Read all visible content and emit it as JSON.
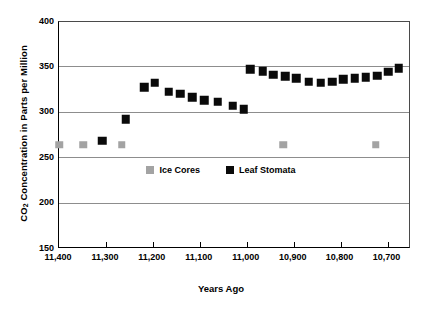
{
  "chart_data": {
    "type": "scatter",
    "title": "",
    "xlabel": "Years Ago",
    "ylabel": "CO2 Concentration in Parts per Million",
    "ylabel_prefix": "CO",
    "ylabel_sub": "2",
    "ylabel_suffix": " Concentration in Parts per Million",
    "xlim": [
      11400,
      10650
    ],
    "ylim": [
      150,
      400
    ],
    "x_inverted": true,
    "grid": true,
    "gridlines_y": [
      200,
      250,
      300,
      350
    ],
    "yticks": [
      400,
      350,
      300,
      250,
      200,
      150
    ],
    "ytick_labels": [
      "400",
      "350",
      "300",
      "250",
      "200",
      "150"
    ],
    "xticks": [
      11400,
      11300,
      11200,
      11100,
      11000,
      10900,
      10800,
      10700
    ],
    "xtick_labels": [
      "11,400",
      "11,300",
      "11,200",
      "11,100",
      "11,000",
      "10,900",
      "10,800",
      "10,700"
    ],
    "legend_position": "center-middle",
    "colors": {
      "ice_cores": "#a3a3a3",
      "leaf_stomata": "#0a0a0a",
      "gridline": "#8d8d8d",
      "axis": "#000000"
    },
    "series": [
      {
        "name": "Ice Cores",
        "marker": "square",
        "color": "#a3a3a3",
        "points": [
          {
            "x": 11400,
            "y": 265
          },
          {
            "x": 11348,
            "y": 265
          },
          {
            "x": 11266,
            "y": 265
          },
          {
            "x": 10922,
            "y": 265
          },
          {
            "x": 10725,
            "y": 265
          }
        ]
      },
      {
        "name": "Leaf Stomata",
        "marker": "square",
        "color": "#0a0a0a",
        "points": [
          {
            "x": 11308,
            "y": 269
          },
          {
            "x": 11258,
            "y": 293
          },
          {
            "x": 11218,
            "y": 328
          },
          {
            "x": 11196,
            "y": 333
          },
          {
            "x": 11166,
            "y": 323
          },
          {
            "x": 11142,
            "y": 321
          },
          {
            "x": 11116,
            "y": 317
          },
          {
            "x": 11090,
            "y": 314
          },
          {
            "x": 11062,
            "y": 312
          },
          {
            "x": 11030,
            "y": 308
          },
          {
            "x": 11006,
            "y": 304
          },
          {
            "x": 10992,
            "y": 348
          },
          {
            "x": 10966,
            "y": 346
          },
          {
            "x": 10944,
            "y": 342
          },
          {
            "x": 10918,
            "y": 340
          },
          {
            "x": 10894,
            "y": 338
          },
          {
            "x": 10868,
            "y": 334
          },
          {
            "x": 10842,
            "y": 333
          },
          {
            "x": 10818,
            "y": 334
          },
          {
            "x": 10794,
            "y": 337
          },
          {
            "x": 10770,
            "y": 338
          },
          {
            "x": 10746,
            "y": 339
          },
          {
            "x": 10722,
            "y": 341
          },
          {
            "x": 10698,
            "y": 345
          },
          {
            "x": 10676,
            "y": 349
          }
        ]
      }
    ]
  },
  "legend": {
    "items": [
      {
        "label": "Ice Cores",
        "key": "ice"
      },
      {
        "label": "Leaf Stomata",
        "key": "stomata"
      }
    ]
  }
}
